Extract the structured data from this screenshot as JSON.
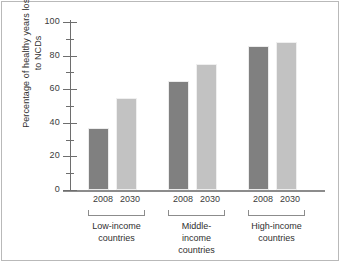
{
  "chart_data": {
    "type": "bar",
    "title": "",
    "xlabel": "",
    "ylabel_line1": "Percentage of healthy years lost due",
    "ylabel_line2": "to NCDs",
    "ylim": [
      0,
      100
    ],
    "ytick_labels": [
      "0",
      "20",
      "40",
      "60",
      "80",
      "100"
    ],
    "ytick_values": [
      0,
      20,
      40,
      60,
      80,
      100
    ],
    "yminor_values": [
      10,
      30,
      50,
      70,
      90
    ],
    "grid": false,
    "legend_position": "none",
    "categories": [
      "Low-income countries",
      "Middle-income countries",
      "High-income countries"
    ],
    "series": [
      {
        "name": "2008",
        "values": [
          37,
          65,
          86
        ],
        "color": "#808080"
      },
      {
        "name": "2030",
        "values": [
          55,
          75,
          88
        ],
        "color": "#c2c2c2"
      }
    ],
    "groups": [
      {
        "name_line1": "Low-income",
        "name_line2": "countries",
        "bars": [
          {
            "year": "2008",
            "value": 37,
            "style": "dark"
          },
          {
            "year": "2030",
            "value": 55,
            "style": "light"
          }
        ]
      },
      {
        "name_line1": "Middle-income",
        "name_line2": "countries",
        "bars": [
          {
            "year": "2008",
            "value": 65,
            "style": "dark"
          },
          {
            "year": "2030",
            "value": 75,
            "style": "light"
          }
        ]
      },
      {
        "name_line1": "High-income",
        "name_line2": "countries",
        "bars": [
          {
            "year": "2008",
            "value": 86,
            "style": "dark"
          },
          {
            "year": "2030",
            "value": 88,
            "style": "light"
          }
        ]
      }
    ]
  }
}
